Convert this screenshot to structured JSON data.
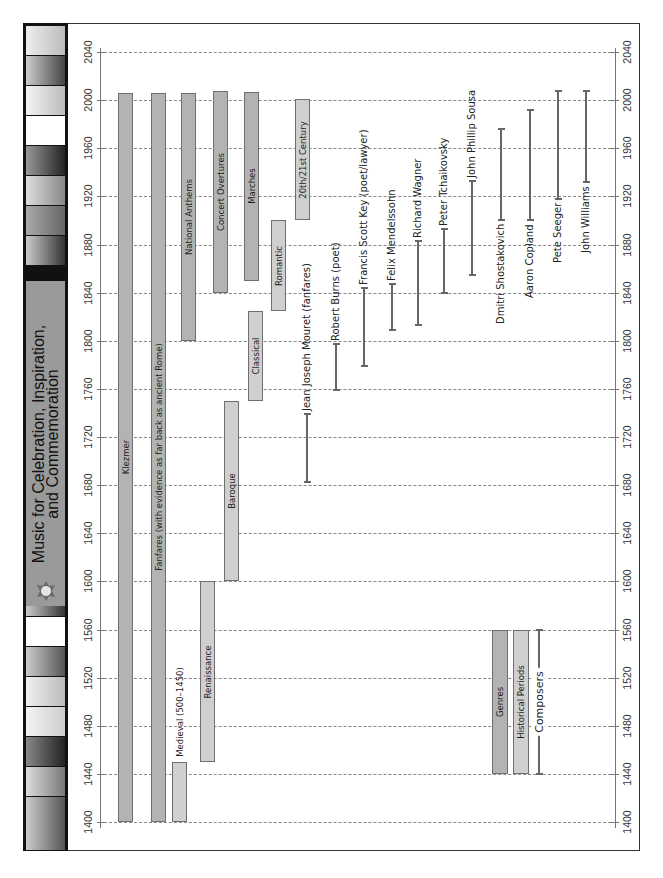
{
  "title": {
    "line1": "Music for Celebration, Inspiration,",
    "line2": "and Commemoration",
    "icon": "medal-icon"
  },
  "colors": {
    "genre_bar": "#b3b3b3",
    "period_bar": "#cfcfcf",
    "composer_line": "#666666",
    "title_panel": "#9a9a9a",
    "gridline": "#888888"
  },
  "chart_data": {
    "type": "timeline",
    "title": "Music for Celebration, Inspiration, and Commemoration",
    "xlabel": "Year",
    "axis_ticks": [
      1400,
      1440,
      1480,
      1520,
      1560,
      1600,
      1640,
      1680,
      1720,
      1760,
      1800,
      1840,
      1880,
      1920,
      1960,
      2000,
      2040
    ],
    "axis_range": [
      1400,
      2040
    ],
    "grid": true,
    "orientation": "rotated-90 (years run bottom to top)",
    "legend": [
      {
        "label": "Genres",
        "style": "dark grey bar"
      },
      {
        "label": "Historical Periods",
        "style": "light grey bar"
      },
      {
        "label": "Composers",
        "style": "line with end caps"
      }
    ],
    "genres": [
      {
        "label": "Klezmer",
        "start": 1400,
        "end": 2006
      },
      {
        "label": "Fanfares (with evidence as far back as ancient Rome)",
        "start": 1400,
        "end": 2006
      },
      {
        "label": "National Anthems",
        "start": 1800,
        "end": 2006
      },
      {
        "label": "Concert Overtures",
        "start": 1840,
        "end": 2008
      },
      {
        "label": "Marches",
        "start": 1850,
        "end": 2007
      }
    ],
    "periods": [
      {
        "label": "Medieval (500–1450)",
        "start": 1400,
        "end": 1450
      },
      {
        "label": "Renaissance",
        "start": 1450,
        "end": 1600
      },
      {
        "label": "Baroque",
        "start": 1600,
        "end": 1750
      },
      {
        "label": "Classical",
        "start": 1750,
        "end": 1825
      },
      {
        "label": "Romantic",
        "start": 1825,
        "end": 1900
      },
      {
        "label": "20th/21st Century",
        "start": 1900,
        "end": 2001
      }
    ],
    "composers": [
      {
        "label": "Jean Joseph Mouret (fanfares)",
        "start": 1683,
        "end": 1739
      },
      {
        "label": "Robert Burns (poet)",
        "start": 1759,
        "end": 1797
      },
      {
        "label": "Francis Scott Key (poet/lawyer)",
        "start": 1779,
        "end": 1844
      },
      {
        "label": "Felix Mendelssohn",
        "start": 1809,
        "end": 1847
      },
      {
        "label": "Richard Wagner",
        "start": 1813,
        "end": 1883
      },
      {
        "label": "Peter Tchaikovsky",
        "start": 1840,
        "end": 1893
      },
      {
        "label": "John Phillip Sousa",
        "start": 1855,
        "end": 1933
      },
      {
        "label": "Dmitri Shostakovich",
        "start": 1900,
        "end": 1976
      },
      {
        "label": "Aaron Copland",
        "start": 1900,
        "end": 1992
      },
      {
        "label": "Pete Seeger",
        "start": 1918,
        "end": 2008
      },
      {
        "label": "John Williams",
        "start": 1932,
        "end": 2008
      }
    ]
  },
  "legend": {
    "genres": "Genres",
    "periods": "Historical Periods",
    "composers": "Composers",
    "start": 1440,
    "end": 1560
  }
}
